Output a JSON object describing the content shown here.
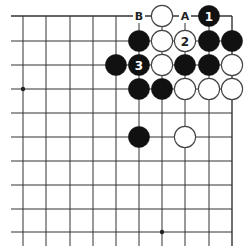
{
  "diagram": {
    "colors": {
      "line": "#333333",
      "black": "#111111",
      "white": "#ffffff",
      "label_on_black": "#ffffff",
      "label_on_white": "#222222",
      "star": "#222222"
    },
    "grid": {
      "xs": [
        23,
        46,
        70,
        93,
        116,
        139,
        162,
        185,
        209,
        232
      ],
      "ys": [
        16,
        41,
        65,
        89,
        113,
        137,
        161,
        185,
        209,
        232
      ],
      "h_line_left": 11,
      "v_line_bottom": 246,
      "top_edge": true,
      "right_edge": true
    },
    "star_points": [
      {
        "c": 0,
        "r": 3
      },
      {
        "c": 6,
        "r": 9
      }
    ],
    "stones": [
      {
        "c": 6,
        "r": 0,
        "color": "white",
        "label": ""
      },
      {
        "c": 8,
        "r": 0,
        "color": "black",
        "label": "1"
      },
      {
        "c": 5,
        "r": 1,
        "color": "black",
        "label": ""
      },
      {
        "c": 6,
        "r": 1,
        "color": "white",
        "label": ""
      },
      {
        "c": 7,
        "r": 1,
        "color": "white",
        "label": "2"
      },
      {
        "c": 8,
        "r": 1,
        "color": "black",
        "label": ""
      },
      {
        "c": 9,
        "r": 1,
        "color": "black",
        "label": ""
      },
      {
        "c": 4,
        "r": 2,
        "color": "black",
        "label": ""
      },
      {
        "c": 5,
        "r": 2,
        "color": "black",
        "label": "3"
      },
      {
        "c": 6,
        "r": 2,
        "color": "white",
        "label": ""
      },
      {
        "c": 7,
        "r": 2,
        "color": "black",
        "label": ""
      },
      {
        "c": 8,
        "r": 2,
        "color": "black",
        "label": ""
      },
      {
        "c": 9,
        "r": 2,
        "color": "white",
        "label": ""
      },
      {
        "c": 5,
        "r": 3,
        "color": "black",
        "label": ""
      },
      {
        "c": 6,
        "r": 3,
        "color": "black",
        "label": ""
      },
      {
        "c": 7,
        "r": 3,
        "color": "white",
        "label": ""
      },
      {
        "c": 8,
        "r": 3,
        "color": "white",
        "label": ""
      },
      {
        "c": 9,
        "r": 3,
        "color": "white",
        "label": ""
      },
      {
        "c": 5,
        "r": 5,
        "color": "black",
        "label": ""
      },
      {
        "c": 7,
        "r": 5,
        "color": "white",
        "label": ""
      }
    ],
    "point_labels": [
      {
        "c": 5,
        "r": 0,
        "text": "B"
      },
      {
        "c": 7,
        "r": 0,
        "text": "A"
      }
    ]
  }
}
